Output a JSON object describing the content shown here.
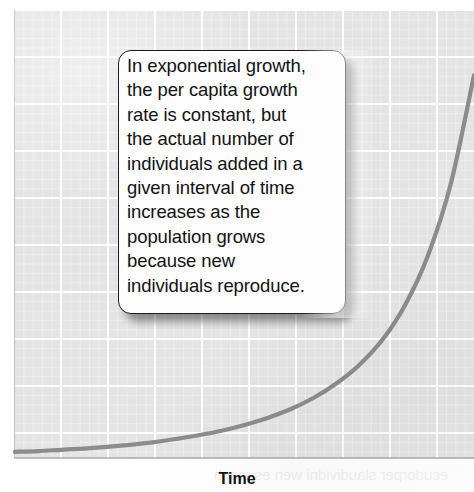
{
  "figure": {
    "kind": "exponential-growth-diagram",
    "callout": {
      "lines": [
        "In exponential growth,",
        "the per capita growth",
        "rate is constant, but",
        "the actual number of",
        "individuals added in a",
        "given interval of time",
        "increases as the",
        "population grows",
        "because new",
        "individuals reproduce."
      ],
      "full_text": "In exponential growth, the per capita growth rate is constant, but the actual number of individuals added in a given interval of time increases as the population grows because new individuals reproduce."
    },
    "x_axis_label": "Time",
    "bleed_through_text": "ecudorper slaudividni wen esuaceb"
  },
  "colors": {
    "plot_background": "#e4e4e4",
    "grid_line": "#ffffff",
    "curve": "#8c8c8c",
    "axis": "#9a9a9a",
    "callout_background": "#fdfdfd",
    "callout_border": "#1b1b1b",
    "text": "#121212",
    "page_background": "#ffffff"
  },
  "chart_data": {
    "type": "line",
    "title": "",
    "subtitle": "",
    "xlabel": "Time",
    "ylabel": "",
    "grid": true,
    "legend": null,
    "axis_ticks_labeled": false,
    "xlim": [
      0,
      100
    ],
    "ylim": [
      0,
      100
    ],
    "annotations": [
      {
        "kind": "callout-box",
        "text": "In exponential growth, the per capita growth rate is constant, but the actual number of individuals added in a given interval of time increases as the population grows because new individuals reproduce.",
        "x_range": [
          22,
          72
        ],
        "y_range": [
          32,
          91
        ]
      }
    ],
    "series": [
      {
        "name": "Exponential growth (N = N0 e^rt)",
        "color": "#8c8c8c",
        "x": [
          0,
          5,
          10,
          15,
          20,
          25,
          30,
          35,
          40,
          45,
          50,
          55,
          60,
          65,
          70,
          75,
          80,
          85,
          90,
          95,
          100
        ],
        "y": [
          1.0,
          1.2,
          1.5,
          1.8,
          2.2,
          2.7,
          3.3,
          4.1,
          5.0,
          6.1,
          7.5,
          9.2,
          11.3,
          14.0,
          17.5,
          22.0,
          28.0,
          36.5,
          48.5,
          66.0,
          92.0
        ]
      }
    ]
  }
}
